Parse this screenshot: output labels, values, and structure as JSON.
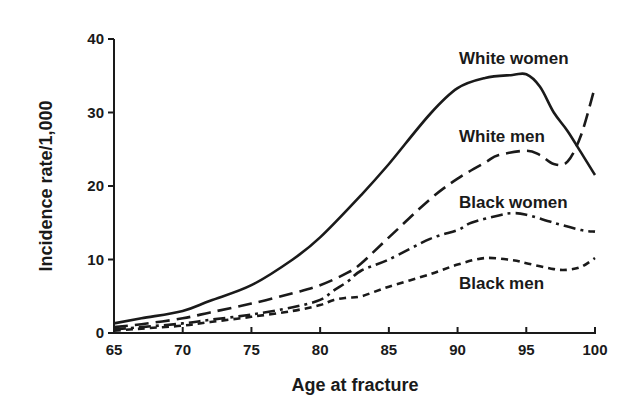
{
  "chart_data": {
    "type": "line",
    "title": "",
    "xlabel": "Age at fracture",
    "ylabel": "Incidence rate/1,000",
    "xlim": [
      65,
      100
    ],
    "ylim": [
      0,
      40
    ],
    "xticks": [
      65,
      70,
      75,
      80,
      85,
      90,
      95,
      100
    ],
    "yticks": [
      0,
      10,
      20,
      30,
      40
    ],
    "grid": false,
    "legend": "inline labels near line ends (right side)",
    "series": [
      {
        "name": "White women",
        "style": "solid",
        "x": [
          65,
          67,
          70,
          72,
          75,
          78,
          80,
          83,
          85,
          88,
          90,
          92,
          94,
          95,
          96,
          97,
          98,
          99,
          100
        ],
        "values": [
          1.3,
          2.0,
          3.0,
          4.4,
          6.5,
          10.0,
          13.0,
          18.8,
          23.0,
          29.8,
          33.3,
          34.7,
          35.1,
          35.2,
          33.5,
          30.0,
          27.5,
          24.5,
          21.5
        ]
      },
      {
        "name": "White men",
        "style": "long-dash",
        "x": [
          65,
          67,
          70,
          72,
          75,
          78,
          80,
          82,
          83,
          85,
          88,
          90,
          92,
          93,
          95,
          96,
          97,
          98,
          99,
          100
        ],
        "values": [
          0.8,
          1.2,
          2.0,
          2.8,
          4.0,
          5.4,
          6.5,
          8.2,
          9.5,
          13.0,
          18.2,
          21.0,
          23.2,
          24.2,
          24.8,
          24.2,
          23.0,
          23.3,
          27.0,
          33.5
        ]
      },
      {
        "name": "Black women",
        "style": "dash-dot",
        "x": [
          65,
          67,
          70,
          72,
          75,
          78,
          80,
          81,
          82,
          83,
          85,
          88,
          90,
          91,
          93,
          94,
          95,
          97,
          99,
          100
        ],
        "values": [
          0.5,
          0.8,
          1.3,
          1.8,
          2.5,
          3.5,
          4.5,
          5.8,
          7.0,
          8.5,
          10.0,
          12.8,
          14.0,
          15.0,
          16.0,
          16.3,
          16.1,
          15.0,
          14.0,
          13.8
        ]
      },
      {
        "name": "Black men",
        "style": "short-dash",
        "x": [
          65,
          67,
          70,
          72,
          75,
          78,
          80,
          81,
          82,
          83,
          85,
          88,
          90,
          92,
          94,
          95,
          97,
          98,
          99,
          100
        ],
        "values": [
          0.3,
          0.6,
          1.0,
          1.5,
          2.2,
          3.0,
          3.8,
          4.5,
          4.8,
          5.0,
          6.3,
          8.0,
          9.3,
          10.2,
          9.9,
          9.5,
          8.7,
          8.6,
          9.0,
          10.2
        ]
      }
    ],
    "annotations": [
      {
        "text": "White women",
        "series": "White women"
      },
      {
        "text": "White men",
        "series": "White men"
      },
      {
        "text": "Black women",
        "series": "Black women"
      },
      {
        "text": "Black men",
        "series": "Black men"
      }
    ]
  }
}
